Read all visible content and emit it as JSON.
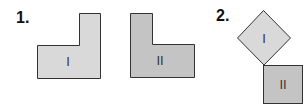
{
  "figures": [
    {
      "number": "1.",
      "shapes": [
        {
          "label": "I",
          "type": "L-shape",
          "fill": "#d9d9d9"
        },
        {
          "label": "II",
          "type": "L-shape",
          "fill": "#c4c4c4"
        }
      ]
    },
    {
      "number": "2.",
      "shapes": [
        {
          "label": "I",
          "type": "square-rotated",
          "fill": "#d9d9d9"
        },
        {
          "label": "II",
          "type": "square",
          "fill": "#c4c4c4"
        }
      ]
    }
  ],
  "colors": {
    "outline": "#333333",
    "light_fill": "#d9d9d9",
    "dark_fill": "#c4c4c4"
  }
}
